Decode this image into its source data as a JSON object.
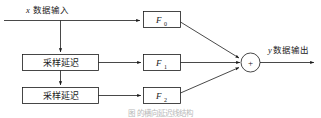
{
  "diagram": {
    "title_caption": "图                 的横向延迟线结构",
    "input": {
      "variable": "x",
      "label": "数据输入",
      "full": "x 数据输入"
    },
    "output": {
      "variable": "y",
      "label": "数据输出",
      "full": "y数据输出"
    },
    "delay_blocks": [
      {
        "id": "delay-1",
        "label": "采样延迟"
      },
      {
        "id": "delay-2",
        "label": "采样延迟"
      }
    ],
    "filter_blocks": [
      {
        "id": "filter-0",
        "base": "F",
        "subscript": "0"
      },
      {
        "id": "filter-1",
        "base": "F",
        "subscript": "1"
      },
      {
        "id": "filter-2",
        "base": "F",
        "subscript": "2"
      }
    ],
    "summing_node": {
      "id": "summing-junction",
      "symbol": "+"
    },
    "colors": {
      "stroke": "#1a1a1a",
      "background": "#ffffff",
      "caption": "#b9b9b9"
    }
  }
}
